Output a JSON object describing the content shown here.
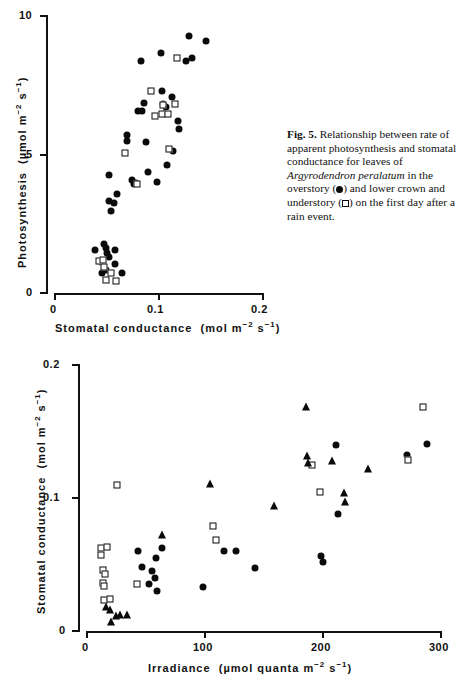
{
  "figure": {
    "caption_label": "Fig. 5.",
    "caption_part1": " Relationship between rate of apparent photosynthesis and stomatal conductance for leaves of ",
    "caption_species": "Argyrodendron peralatum",
    "caption_part2": " in the overstory (",
    "caption_part3": ") and lower crown and understory (",
    "caption_part4": ") on the first day after a rain event.",
    "symbol_overstory": "filled-circle",
    "symbol_understory": "open-square"
  },
  "chart_data": [
    {
      "id": "top",
      "type": "scatter",
      "title": "",
      "xlabel": "Stomatal conductance",
      "xunits": "(mol m⁻² s⁻¹)",
      "ylabel": "Photosynthesis",
      "yunits": "(µmol m⁻² s⁻¹)",
      "xlim": [
        0,
        0.2
      ],
      "ylim": [
        0,
        10
      ],
      "xticks": [
        0,
        0.1,
        0.2
      ],
      "xticklabels": [
        "0",
        "0.1",
        "0.2"
      ],
      "yticks": [
        0,
        5,
        10
      ],
      "yticklabels": [
        "0",
        "5",
        "10"
      ],
      "grid": false,
      "legend": "none",
      "series": [
        {
          "name": "overstory",
          "marker": "filled-circle",
          "points": [
            [
              0.0395,
              1.55
            ],
            [
              0.0475,
              1.75
            ],
            [
              0.0495,
              1.62
            ],
            [
              0.0505,
              1.45
            ],
            [
              0.0445,
              1.12
            ],
            [
              0.0525,
              1.28
            ],
            [
              0.0455,
              0.72
            ],
            [
              0.0495,
              0.82
            ],
            [
              0.0585,
              1.55
            ],
            [
              0.0585,
              1.05
            ],
            [
              0.0655,
              0.72
            ],
            [
              0.0525,
              3.3
            ],
            [
              0.0545,
              2.95
            ],
            [
              0.0575,
              3.22
            ],
            [
              0.0605,
              3.55
            ],
            [
              0.0525,
              4.25
            ],
            [
              0.0695,
              5.7
            ],
            [
              0.0695,
              5.45
            ],
            [
              0.0745,
              4.05
            ],
            [
              0.0765,
              3.92
            ],
            [
              0.0785,
              3.95
            ],
            [
              0.0895,
              4.35
            ],
            [
              0.0985,
              3.98
            ],
            [
              0.0805,
              6.55
            ],
            [
              0.0845,
              6.55
            ],
            [
              0.0865,
              6.85
            ],
            [
              0.0835,
              8.35
            ],
            [
              0.0885,
              5.42
            ],
            [
              0.1035,
              7.25
            ],
            [
              0.1025,
              8.65
            ],
            [
              0.1045,
              6.8
            ],
            [
              0.1055,
              6.45
            ],
            [
              0.1075,
              6.7
            ],
            [
              0.1085,
              4.62
            ],
            [
              0.1125,
              7.05
            ],
            [
              0.1135,
              5.12
            ],
            [
              0.1185,
              6.2
            ],
            [
              0.1195,
              5.9
            ],
            [
              0.1265,
              8.35
            ],
            [
              0.1295,
              9.25
            ],
            [
              0.1325,
              8.45
            ],
            [
              0.1455,
              9.05
            ]
          ]
        },
        {
          "name": "understory",
          "marker": "open-square",
          "points": [
            [
              0.0435,
              1.15
            ],
            [
              0.0465,
              1.18
            ],
            [
              0.0475,
              0.95
            ],
            [
              0.0495,
              0.48
            ],
            [
              0.0545,
              0.72
            ],
            [
              0.0595,
              0.42
            ],
            [
              0.0675,
              5.05
            ],
            [
              0.0795,
              3.92
            ],
            [
              0.0925,
              7.25
            ],
            [
              0.0965,
              6.35
            ],
            [
              0.1035,
              6.45
            ],
            [
              0.1045,
              6.75
            ],
            [
              0.1095,
              6.45
            ],
            [
              0.1105,
              5.18
            ],
            [
              0.1155,
              6.8
            ],
            [
              0.1175,
              8.45
            ]
          ]
        }
      ]
    },
    {
      "id": "bottom",
      "type": "scatter",
      "title": "",
      "xlabel": "Irradiance",
      "xunits": "(µmol quanta m⁻² s⁻¹)",
      "ylabel": "Stomatal conductance",
      "yunits": "(mol m⁻² s⁻¹)",
      "xlim": [
        0,
        300
      ],
      "ylim": [
        0,
        0.2
      ],
      "xticks": [
        0,
        100,
        200,
        300
      ],
      "xticklabels": [
        "0",
        "100",
        "200",
        "300"
      ],
      "yticks": [
        0,
        0.1,
        0.2
      ],
      "yticklabels": [
        "0",
        "0.1",
        "0.2"
      ],
      "grid": false,
      "legend": "none",
      "series": [
        {
          "name": "filled-circles",
          "marker": "filled-circle",
          "points": [
            [
              44,
              0.06
            ],
            [
              47,
              0.048
            ],
            [
              53,
              0.035
            ],
            [
              56,
              0.045
            ],
            [
              58,
              0.04
            ],
            [
              59,
              0.055
            ],
            [
              60,
              0.03
            ],
            [
              64,
              0.062
            ],
            [
              99,
              0.033
            ],
            [
              117,
              0.06
            ],
            [
              127,
              0.06
            ],
            [
              143,
              0.047
            ],
            [
              199,
              0.056
            ],
            [
              200,
              0.052
            ],
            [
              211,
              0.139
            ],
            [
              213,
              0.088
            ],
            [
              271,
              0.132
            ],
            [
              288,
              0.14
            ]
          ]
        },
        {
          "name": "open-squares",
          "marker": "open-square",
          "points": [
            [
              13,
              0.062
            ],
            [
              18,
              0.063
            ],
            [
              13,
              0.057
            ],
            [
              14,
              0.046
            ],
            [
              16,
              0.043
            ],
            [
              14,
              0.036
            ],
            [
              15,
              0.034
            ],
            [
              15,
              0.023
            ],
            [
              20,
              0.024
            ],
            [
              26,
              0.109
            ],
            [
              43,
              0.035
            ],
            [
              107,
              0.079
            ],
            [
              110,
              0.068
            ],
            [
              191,
              0.124
            ],
            [
              198,
              0.104
            ],
            [
              272,
              0.128
            ],
            [
              285,
              0.168
            ]
          ]
        },
        {
          "name": "filled-triangles",
          "marker": "filled-triangle",
          "points": [
            [
              17,
              0.018
            ],
            [
              20,
              0.016
            ],
            [
              21,
              0.007
            ],
            [
              25,
              0.011
            ],
            [
              29,
              0.012
            ],
            [
              35,
              0.012
            ],
            [
              64,
              0.072
            ],
            [
              105,
              0.11
            ],
            [
              159,
              0.094
            ],
            [
              186,
              0.168
            ],
            [
              187,
              0.131
            ],
            [
              188,
              0.126
            ],
            [
              208,
              0.127
            ],
            [
              218,
              0.103
            ],
            [
              219,
              0.097
            ],
            [
              238,
              0.121
            ]
          ]
        }
      ]
    }
  ]
}
